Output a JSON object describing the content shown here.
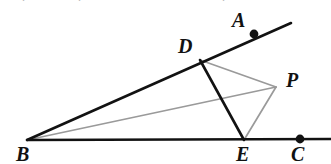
{
  "figure": {
    "width": 331,
    "height": 164,
    "background": "#ffffff",
    "stroke_dark": "#121212",
    "stroke_gray": "#9a9a9a",
    "points": [
      {
        "id": "A",
        "label": "A",
        "x": 254,
        "y": 34,
        "dot": true,
        "label_x": 232,
        "label_y": 10
      },
      {
        "id": "B",
        "label": "B",
        "x": 27,
        "y": 140,
        "dot": false,
        "label_x": 16,
        "label_y": 144
      },
      {
        "id": "C",
        "label": "C",
        "x": 300,
        "y": 139,
        "dot": true,
        "label_x": 291,
        "label_y": 144
      },
      {
        "id": "D",
        "label": "D",
        "x": 200,
        "y": 60,
        "dot": false,
        "label_x": 178,
        "label_y": 36
      },
      {
        "id": "E",
        "label": "E",
        "x": 244,
        "y": 140,
        "dot": false,
        "label_x": 236,
        "label_y": 144
      },
      {
        "id": "P",
        "label": "P",
        "x": 276,
        "y": 87,
        "dot": false,
        "label_x": 286,
        "label_y": 70
      }
    ],
    "segments": [
      {
        "id": "ray-BA",
        "from": "B",
        "to": "A",
        "color": "#121212",
        "width": 2.6,
        "x1": 27,
        "y1": 140,
        "x2": 291,
        "y2": 23
      },
      {
        "id": "ray-BC",
        "from": "B",
        "to": "C",
        "color": "#121212",
        "width": 2.4,
        "x1": 27,
        "y1": 140,
        "x2": 331,
        "y2": 139
      },
      {
        "id": "seg-DE",
        "from": "D",
        "to": "E",
        "color": "#121212",
        "width": 2.6,
        "x1": 200,
        "y1": 60,
        "x2": 244,
        "y2": 140
      },
      {
        "id": "seg-BP",
        "from": "B",
        "to": "P",
        "color": "#9a9a9a",
        "width": 1.7,
        "x1": 27,
        "y1": 140,
        "x2": 276,
        "y2": 87
      },
      {
        "id": "seg-DP",
        "from": "D",
        "to": "P",
        "color": "#9a9a9a",
        "width": 1.7,
        "x1": 200,
        "y1": 60,
        "x2": 276,
        "y2": 87
      },
      {
        "id": "seg-PE",
        "from": "P",
        "to": "E",
        "color": "#9a9a9a",
        "width": 1.7,
        "x1": 276,
        "y1": 87,
        "x2": 244,
        "y2": 140
      }
    ],
    "dot_radius": 4.4,
    "top_crumbs": [
      {
        "text": ".",
        "x": 22
      },
      {
        "text": ".",
        "x": 78
      },
      {
        "text": ".",
        "x": 222
      }
    ]
  }
}
